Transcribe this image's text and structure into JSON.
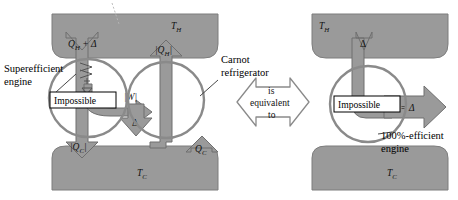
{
  "figure": {
    "title_fragment": "",
    "type": "thermodynamics-proof-diagram",
    "caption": ""
  },
  "colors": {
    "reservoir_fill": "#9a9a9a",
    "reservoir_stroke": "#7d7d7d",
    "arrow_fill": "#9a9a9a",
    "arrow_stroke": "#6f6f6f",
    "circle_stroke": "#8a8a8a",
    "outline_arrow_stroke": "#8a8a8a",
    "outline_arrow_fill": "#ffffff",
    "label_text": "#111111",
    "box_fill": "#ffffff",
    "box_stroke": "#000000",
    "leader_line": "#333333",
    "page_background": "#ffffff"
  },
  "left_panel": {
    "hot_reservoir_label": "T",
    "hot_reservoir_sub": "H",
    "cold_reservoir_label": "T",
    "cold_reservoir_sub": "C",
    "engine": {
      "callout_line1": "Superefficient",
      "callout_line2": "engine",
      "badge_label": "Impossible",
      "heat_in_label": "Q",
      "heat_in_sub": "H",
      "heat_in_extra": " + Δ",
      "heat_out_label": "|Q",
      "heat_out_sub": "C",
      "heat_out_close": "|"
    },
    "refrigerator": {
      "callout_line1": "Carnot",
      "callout_line2": "refrigerator",
      "heat_out_label": "|Q",
      "heat_out_sub": "H",
      "heat_out_close": "|",
      "heat_in_label": "Q",
      "heat_in_sub": "C"
    },
    "work_label": "|W|",
    "surplus_label": "Δ"
  },
  "equivalence": {
    "line1": "is",
    "line2": "equivalent",
    "line3": "to"
  },
  "right_panel": {
    "hot_reservoir_label": "T",
    "hot_reservoir_sub": "H",
    "cold_reservoir_label": "T",
    "cold_reservoir_sub": "C",
    "heat_in_label": "Δ",
    "badge_label": "Impossible",
    "work_label": "W = Δ",
    "callout_line1": "100%-efficient",
    "callout_line2": "engine"
  }
}
